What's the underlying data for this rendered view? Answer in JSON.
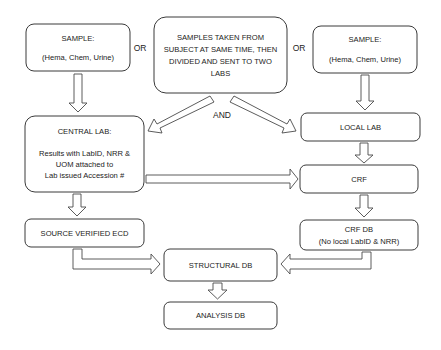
{
  "diagram": {
    "nodes": {
      "sample_left": {
        "line1": "SAMPLE:",
        "line2": "(Hema, Chem, Urine)"
      },
      "samples_split": {
        "line1": "SAMPLES TAKEN FROM",
        "line2": "SUBJECT AT SAME TIME, THEN",
        "line3": "DIVIDED AND SENT TO TWO",
        "line4": "LABS"
      },
      "sample_right": {
        "line1": "SAMPLE:",
        "line2": "(Hema, Chem, Urine)"
      },
      "central_lab": {
        "line1": "CENTRAL LAB:",
        "line2": "Results with LabID, NRR &",
        "line3": "UOM attached to",
        "line4": "Lab issued Accession #"
      },
      "local_lab": {
        "label": "LOCAL LAB"
      },
      "crf": {
        "label": "CRF"
      },
      "source_verified_ecd": {
        "label": "SOURCE VERIFIED ECD"
      },
      "crf_db": {
        "line1": "CRF DB",
        "line2": "(No local LabID & NRR)"
      },
      "structural_db": {
        "label": "STRUCTURAL DB"
      },
      "analysis_db": {
        "label": "ANALYSIS DB"
      }
    },
    "connectors": {
      "or_left": "OR",
      "or_right": "OR",
      "and": "AND"
    },
    "edges": [
      {
        "from": "sample_left",
        "to": "central_lab"
      },
      {
        "from": "samples_split",
        "to": "central_lab"
      },
      {
        "from": "samples_split",
        "to": "local_lab"
      },
      {
        "from": "sample_right",
        "to": "local_lab"
      },
      {
        "from": "central_lab",
        "to": "crf"
      },
      {
        "from": "central_lab",
        "to": "source_verified_ecd"
      },
      {
        "from": "local_lab",
        "to": "crf"
      },
      {
        "from": "crf",
        "to": "crf_db"
      },
      {
        "from": "source_verified_ecd",
        "to": "structural_db"
      },
      {
        "from": "crf_db",
        "to": "structural_db"
      },
      {
        "from": "structural_db",
        "to": "analysis_db"
      }
    ]
  }
}
